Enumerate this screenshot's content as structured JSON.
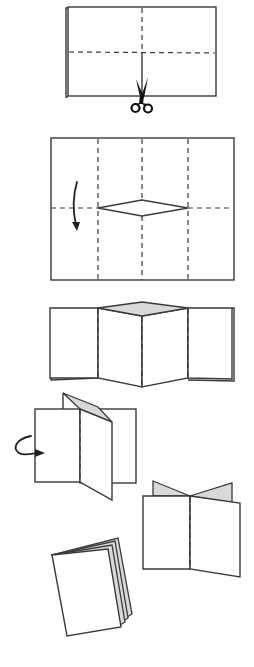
{
  "diagram": {
    "title": "Folding an eight-page mini booklet from one sheet",
    "colors": {
      "line": "#3a3a3a",
      "fold_line": "#3a3a3a",
      "shaded_inside": "#d9d9d9",
      "paper": "#ffffff",
      "icon": "#111111"
    },
    "steps": [
      {
        "id": 1,
        "label": "Fold the sheet in half and mark fold lines; cut along the center fold from the folded edge",
        "elements": [
          "folded-sheet",
          "vertical-fold-line",
          "horizontal-fold-line",
          "center-cut-line",
          "scissors-icon"
        ]
      },
      {
        "id": 2,
        "label": "Open sheet showing 8 panels with a diamond slit cut in the center; fold top half down",
        "elements": [
          "sheet-8-panels",
          "three-vertical-fold-lines",
          "horizontal-fold-line",
          "diamond-slit",
          "fold-down-arrow"
        ]
      },
      {
        "id": 3,
        "label": "Folded lengthwise with the slit opening into a shaded diamond",
        "elements": [
          "folded-strip",
          "shaded-diamond-opening",
          "two-vertical-fold-lines",
          "center-fold-line"
        ]
      },
      {
        "id": 4,
        "label": "Push the ends together and wrap the pages around",
        "elements": [
          "partially-folded-booklet",
          "shaded-flap",
          "wrap-around-arrow"
        ]
      },
      {
        "id": 5,
        "label": "Pages forming a cross shape from the top",
        "elements": [
          "cross-folded-pages",
          "two-shaded-flaps",
          "spine-fold-line"
        ]
      },
      {
        "id": 6,
        "label": "Finished booklet",
        "elements": [
          "finished-booklet"
        ]
      }
    ]
  }
}
